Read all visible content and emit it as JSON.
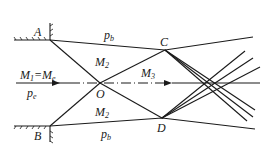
{
  "diagram": {
    "type": "underexpanded-jet-shock-diagram",
    "labels": {
      "A": "A",
      "B": "B",
      "C": "C",
      "D": "D",
      "O": "O",
      "pb_top": "p",
      "pb_top_sub": "b",
      "pb_bottom": "p",
      "pb_bottom_sub": "b",
      "M2_top": "M",
      "M2_top_sub": "2",
      "M2_bottom": "M",
      "M2_bottom_sub": "2",
      "M3": "M",
      "M3_sub": "3",
      "M1_main": "M",
      "M1_sub": "1",
      "M1_eq": "=M",
      "M1_eq_sub": "e",
      "pe": "p",
      "pe_sub": "e"
    },
    "points": {
      "A": [
        50,
        40
      ],
      "B": [
        50,
        126
      ],
      "O": [
        100,
        83
      ],
      "C": [
        165,
        50
      ],
      "D": [
        162,
        118
      ]
    },
    "colors": {
      "line": "#1a1a1a",
      "background": "#ffffff"
    }
  }
}
